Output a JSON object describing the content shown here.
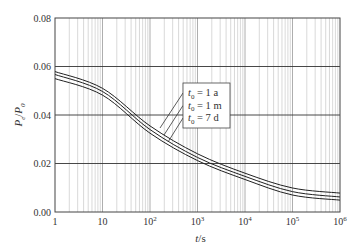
{
  "chart_data": {
    "type": "line",
    "title": "",
    "xlabel": "t/s",
    "ylabel": "Pe/P0",
    "xscale": "log",
    "xlim": [
      1,
      1000000
    ],
    "ylim": [
      0,
      0.08
    ],
    "x_ticks": [
      {
        "value": 1,
        "label": "1",
        "sup": ""
      },
      {
        "value": 10,
        "label": "10",
        "sup": ""
      },
      {
        "value": 100,
        "label": "10",
        "sup": "2"
      },
      {
        "value": 1000,
        "label": "10",
        "sup": "3"
      },
      {
        "value": 10000,
        "label": "10",
        "sup": "4"
      },
      {
        "value": 100000,
        "label": "10",
        "sup": "5"
      },
      {
        "value": 1000000,
        "label": "10",
        "sup": "6"
      }
    ],
    "y_ticks": [
      {
        "value": 0.0,
        "label": "0.00"
      },
      {
        "value": 0.02,
        "label": "0.02"
      },
      {
        "value": 0.04,
        "label": "0.04"
      },
      {
        "value": 0.06,
        "label": "0.06"
      },
      {
        "value": 0.08,
        "label": "0.08"
      }
    ],
    "grid": {
      "horizontal_major": true,
      "vertical_log_minor": true
    },
    "x": [
      1,
      10,
      100,
      1000,
      10000,
      100000,
      1000000
    ],
    "series": [
      {
        "name": "t0 = 1 a",
        "values": [
          0.0579,
          0.051,
          0.0355,
          0.024,
          0.016,
          0.0099,
          0.0078
        ]
      },
      {
        "name": "t0 = 1 m",
        "values": [
          0.0567,
          0.0497,
          0.034,
          0.0225,
          0.0147,
          0.0084,
          0.0062
        ]
      },
      {
        "name": "t0 = 7 d",
        "values": [
          0.055,
          0.0482,
          0.0325,
          0.0212,
          0.0134,
          0.007,
          0.0049
        ]
      }
    ],
    "legend": {
      "position": "inside-center-right",
      "entries": [
        {
          "sym": "t",
          "sub": "0",
          "rest": " = 1 a"
        },
        {
          "sym": "t",
          "sub": "0",
          "rest": " = 1 m"
        },
        {
          "sym": "t",
          "sub": "0",
          "rest": " = 7 d"
        }
      ]
    },
    "axis_labels": {
      "x": {
        "var": "t",
        "unit": "/s"
      },
      "y": {
        "num": "P",
        "num_sub": "e",
        "den": "P",
        "den_sub": "0"
      }
    }
  }
}
